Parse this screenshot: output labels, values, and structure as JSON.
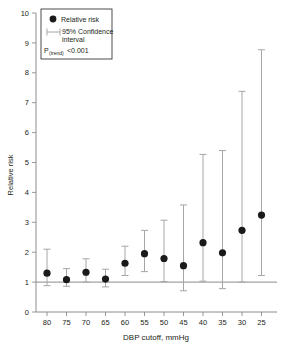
{
  "chart_data": {
    "type": "scatter",
    "title": "",
    "xlabel": "DBP cutoff, mmHg",
    "ylabel": "Relative risk",
    "categories": [
      "80",
      "75",
      "70",
      "65",
      "60",
      "55",
      "50",
      "45",
      "40",
      "35",
      "30",
      "25"
    ],
    "values": [
      1.3,
      1.08,
      1.33,
      1.1,
      1.63,
      1.95,
      1.79,
      1.55,
      2.32,
      1.98,
      2.73,
      3.24
    ],
    "ci_low": [
      0.88,
      0.86,
      1.0,
      0.84,
      1.22,
      1.35,
      1.02,
      0.71,
      1.03,
      0.78,
      1.0,
      1.22
    ],
    "ci_high": [
      2.1,
      1.45,
      1.78,
      1.43,
      2.2,
      2.73,
      3.07,
      3.58,
      5.27,
      5.4,
      7.38,
      8.77
    ],
    "ylim": [
      0,
      10
    ],
    "yticks": [
      "0",
      "1",
      "2",
      "3",
      "4",
      "5",
      "6",
      "7",
      "8",
      "9",
      "10"
    ],
    "reference_line": 1,
    "grid": false,
    "legend_position": "top-left",
    "series_name": "Relative risk",
    "error_bar_name": "95% Confidence interval"
  },
  "legend": {
    "point_label": "Relative risk",
    "ci_label_line1": "95% Confidence",
    "ci_label_line2": "interval",
    "p_prefix": "P",
    "p_subscript": "(trend)",
    "p_value": "<0.001"
  },
  "axes": {
    "x_title": "DBP cutoff, mmHg",
    "y_title": "Relative risk"
  }
}
